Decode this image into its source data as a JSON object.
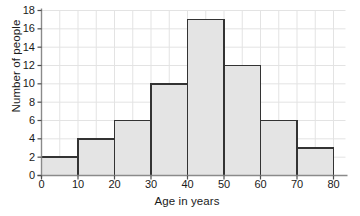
{
  "chart_data": {
    "type": "bar",
    "title": "",
    "xlabel": "Age in years",
    "ylabel": "Number of people",
    "categories": [
      "0-10",
      "10-20",
      "20-30",
      "30-40",
      "40-50",
      "50-60",
      "60-70",
      "70-80"
    ],
    "bin_edges": [
      0,
      10,
      20,
      30,
      40,
      50,
      60,
      70,
      80
    ],
    "values": [
      2,
      4,
      6,
      10,
      17,
      12,
      6,
      3
    ],
    "xlim": [
      0,
      80
    ],
    "ylim": [
      0,
      18
    ],
    "x_ticks": [
      0,
      10,
      20,
      30,
      40,
      50,
      60,
      70,
      80
    ],
    "y_ticks": [
      0,
      2,
      4,
      6,
      8,
      10,
      12,
      14,
      16,
      18
    ],
    "x_tick_labels": [
      "0",
      "10",
      "20",
      "30",
      "40",
      "50",
      "60",
      "70",
      "80"
    ],
    "y_tick_labels": [
      "0",
      "2",
      "4",
      "6",
      "8",
      "10",
      "12",
      "14",
      "16",
      "18"
    ],
    "x_minor_step": 5,
    "y_minor_step": 2,
    "grid": true,
    "legend": "none",
    "bar_fill_color": "#e4e4e4",
    "bar_edge_color": "#333333",
    "grid_color": "#e3e3e3",
    "axis_color": "#4d4d4d",
    "text_color": "#1a1a1a"
  }
}
